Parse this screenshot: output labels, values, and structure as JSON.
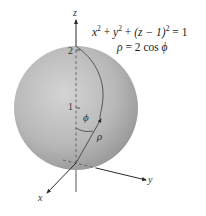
{
  "figure": {
    "type": "3d-spherical-coordinates-diagram",
    "equation_cartesian": {
      "terms": [
        "x",
        "2",
        "y",
        "2",
        "(z − 1)",
        "2",
        "1"
      ],
      "text": "x² + y² + (z − 1)² = 1"
    },
    "equation_spherical": {
      "text": "ρ = 2 cos ϕ",
      "rho": "ρ",
      "rhs": "= 2 cos",
      "phi": "ϕ"
    },
    "axes": {
      "z": "z",
      "y": "y",
      "x": "x"
    },
    "tick_labels": {
      "z_2": "2",
      "z_1": "1"
    },
    "annotations": {
      "angle": "ϕ",
      "radius": "ρ"
    },
    "colors": {
      "sphere_light": "#d2d2d2",
      "sphere_mid": "#b2b2b2",
      "sphere_dark": "#8f8f8f",
      "lines": "#3a3a3a",
      "background": "#ffffff"
    }
  }
}
